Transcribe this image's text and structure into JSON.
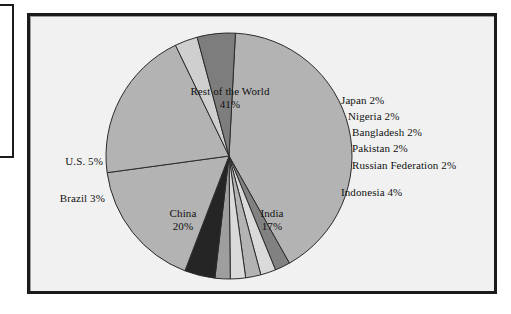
{
  "figure": {
    "background_color": "#f1f1f1",
    "frame_color": "#1b1b1b",
    "page_background": "#ffffff"
  },
  "chart_data": {
    "type": "pie",
    "title": "",
    "subtitle": "",
    "xlabel": "",
    "ylabel": "",
    "legend_position": "none",
    "grid": false,
    "units": "percent",
    "total": 100,
    "start_angle_deg": -87,
    "direction": "clockwise",
    "categories": [
      "Rest of the World",
      "Japan",
      "Nigeria",
      "Bangladesh",
      "Pakistan",
      "Russian Federation",
      "Indonesia",
      "India",
      "China",
      "Brazil",
      "U.S."
    ],
    "values": [
      41,
      2,
      2,
      2,
      2,
      2,
      4,
      17,
      20,
      3,
      5
    ],
    "slices": [
      {
        "name": "Rest of the World",
        "label": "Rest of the World",
        "value": 41,
        "percent_text": "41%",
        "color": "#b3b3b3",
        "label_placement": "inside",
        "label_x": 230,
        "label_y": 85
      },
      {
        "name": "Japan",
        "label": "Japan",
        "value": 2,
        "percent_text": "2%",
        "callout_text": "Japan 2%",
        "color": "#818181",
        "label_placement": "outside-right",
        "label_x": 341,
        "label_y": 94
      },
      {
        "name": "Nigeria",
        "label": "Nigeria",
        "value": 2,
        "percent_text": "2%",
        "callout_text": "Nigeria 2%",
        "color": "#dadada",
        "label_placement": "outside-right",
        "label_x": 348,
        "label_y": 110
      },
      {
        "name": "Bangladesh",
        "label": "Bangladesh",
        "value": 2,
        "percent_text": "2%",
        "callout_text": "Bangladesh 2%",
        "color": "#b3b3b3",
        "label_placement": "outside-right",
        "label_x": 352,
        "label_y": 126
      },
      {
        "name": "Pakistan",
        "label": "Pakistan",
        "value": 2,
        "percent_text": "2%",
        "callout_text": "Pakistan 2%",
        "color": "#dadada",
        "label_placement": "outside-right",
        "label_x": 352,
        "label_y": 142
      },
      {
        "name": "Russian Federation",
        "label": "Russian Federation",
        "value": 2,
        "percent_text": "2%",
        "callout_text": "Russian Federation 2%",
        "color": "#9e9e9e",
        "label_placement": "outside-right",
        "label_x": 352,
        "label_y": 159
      },
      {
        "name": "Indonesia",
        "label": "Indonesia",
        "value": 4,
        "percent_text": "4%",
        "callout_text": "Indonesia 4%",
        "color": "#252525",
        "label_placement": "outside-right",
        "label_x": 341,
        "label_y": 186
      },
      {
        "name": "India",
        "label": "India",
        "value": 17,
        "percent_text": "17%",
        "color": "#b3b3b3",
        "label_placement": "inside",
        "label_x": 272,
        "label_y": 207
      },
      {
        "name": "China",
        "label": "China",
        "value": 20,
        "percent_text": "20%",
        "color": "#b3b3b3",
        "label_placement": "inside",
        "label_x": 183,
        "label_y": 207
      },
      {
        "name": "Brazil",
        "label": "Brazil",
        "value": 3,
        "percent_text": "3%",
        "callout_text": "Brazil 3%",
        "color": "#cfcfcf",
        "label_placement": "outside-left",
        "label_x": 105,
        "label_y": 192
      },
      {
        "name": "U.S.",
        "label": "U.S.",
        "value": 5,
        "percent_text": "5%",
        "callout_text": "U.S. 5%",
        "color": "#7d7d7d",
        "label_placement": "outside-left",
        "label_x": 103,
        "label_y": 155
      }
    ],
    "geometry": {
      "center_x": 229,
      "center_y": 156,
      "radius": 123,
      "outline_color": "#2b2b2b"
    }
  }
}
